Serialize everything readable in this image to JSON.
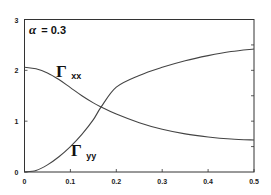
{
  "chart_data": {
    "type": "line",
    "title": "",
    "xlabel": "",
    "ylabel": "",
    "xlim": [
      0,
      0.5
    ],
    "ylim": [
      0,
      3
    ],
    "grid": false,
    "legend": "none (inline curve labels)",
    "x_ticks": [
      "0",
      "0.1",
      "0.2",
      "0.3",
      "0.4",
      "0.5"
    ],
    "y_ticks": [
      "0",
      "1",
      "2",
      "3"
    ],
    "annotations": [
      {
        "text": "α = 0.3",
        "position": "top-left"
      },
      {
        "text": "Γxx",
        "label_for": "Gamma_xx"
      },
      {
        "text": "Γyy",
        "label_for": "Gamma_yy"
      }
    ],
    "x": [
      0,
      0.025,
      0.05,
      0.075,
      0.1,
      0.125,
      0.15,
      0.167,
      0.2,
      0.25,
      0.3,
      0.35,
      0.4,
      0.45,
      0.5
    ],
    "series": [
      {
        "name": "Γxx",
        "values": [
          2.06,
          2.03,
          1.95,
          1.82,
          1.66,
          1.5,
          1.36,
          1.28,
          1.14,
          0.97,
          0.84,
          0.75,
          0.69,
          0.65,
          0.63
        ]
      },
      {
        "name": "Γyy",
        "values": [
          0.0,
          0.03,
          0.14,
          0.3,
          0.5,
          0.74,
          1.03,
          1.28,
          1.67,
          1.9,
          2.06,
          2.19,
          2.29,
          2.37,
          2.42
        ]
      }
    ]
  },
  "labels": {
    "alpha_symbol": "α",
    "alpha_text": "= 0.3",
    "gamma_symbol": "Γ",
    "gxx_sub": "xx",
    "gyy_sub": "yy"
  },
  "axes": {
    "x_tick_labels": [
      "0",
      "0.1",
      "0.2",
      "0.3",
      "0.4",
      "0.5"
    ],
    "y_tick_labels": [
      "0",
      "1",
      "2",
      "3"
    ]
  }
}
